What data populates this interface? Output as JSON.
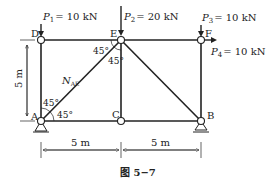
{
  "figure": {
    "caption": "图 5−7",
    "colors": {
      "ink": "#222222",
      "background": "#ffffff"
    }
  },
  "nodes": {
    "A": {
      "label": "A",
      "support": "pin"
    },
    "B": {
      "label": "B",
      "support": "roller"
    },
    "C": {
      "label": "C"
    },
    "D": {
      "label": "D"
    },
    "E": {
      "label": "E"
    },
    "F": {
      "label": "F"
    }
  },
  "members": [
    "DE",
    "EF",
    "DA",
    "EC",
    "FB",
    "AC",
    "CB",
    "AE",
    "EB"
  ],
  "loads": [
    {
      "sym": "P",
      "sub": "1",
      "value": "= 10 kN",
      "node": "D",
      "direction": "down"
    },
    {
      "sym": "P",
      "sub": "2",
      "value": "= 20 kN",
      "node": "E",
      "direction": "down"
    },
    {
      "sym": "P",
      "sub": "3",
      "value": "= 10 kN",
      "node": "F",
      "direction": "down"
    },
    {
      "sym": "P",
      "sub": "4",
      "value": "= 10 kN",
      "node": "F",
      "direction": "right"
    }
  ],
  "member_force_label": {
    "sym": "N",
    "sub": "AE"
  },
  "angles": {
    "at_E_left": "45°",
    "at_E_lower": "45°",
    "at_A_upper": "45°",
    "at_A_right": "45°"
  },
  "dimensions": {
    "height": "5 m",
    "span_left": "5 m",
    "span_right": "5 m"
  }
}
